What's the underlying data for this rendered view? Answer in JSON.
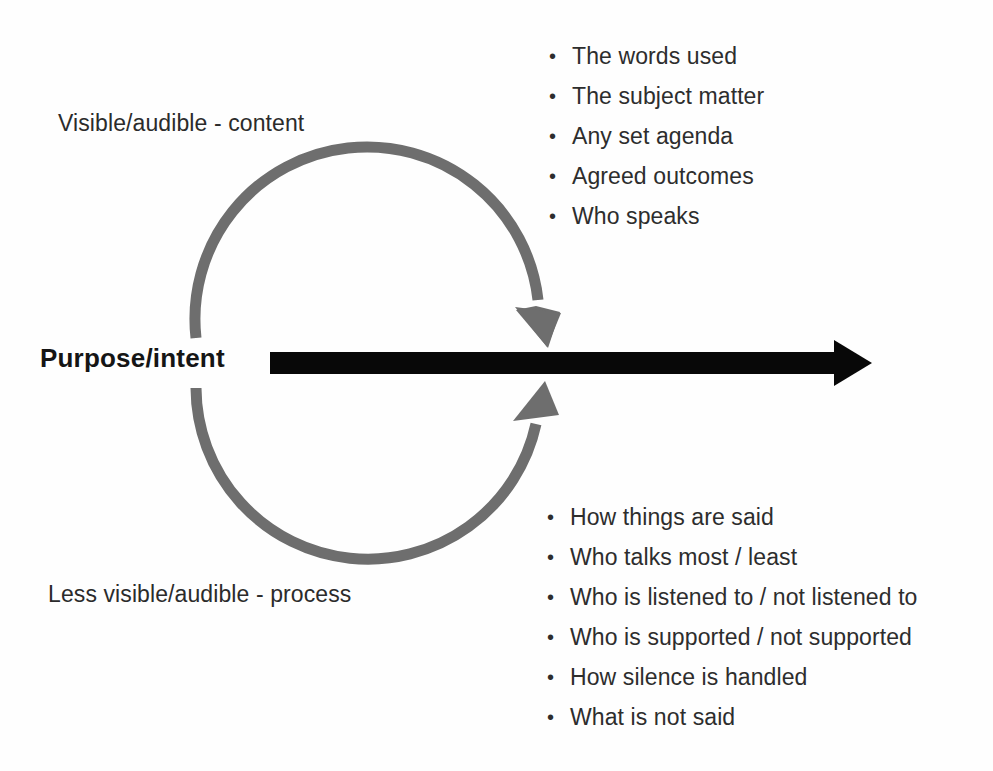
{
  "canvas": {
    "width": 993,
    "height": 771,
    "background": "#ffffff"
  },
  "diagram": {
    "title_text": "",
    "labels": {
      "upper_left": "Visible/audible - content",
      "lower_left": "Less visible/audible - process",
      "axis_label": "Purpose/intent"
    },
    "shapes": {
      "horizontal_arrow": {
        "name": "purpose-intent-arrow",
        "color": "#080808",
        "direction": "right",
        "shaft_start_x": 270,
        "shaft_end_x": 838,
        "tip_x": 872,
        "center_y": 363,
        "thickness": 22
      },
      "cycle_arrow_upper": {
        "name": "upper-cycle-arc",
        "color": "#6e6e6e",
        "direction": "clockwise-down-to-axis",
        "stroke_width": 11
      },
      "cycle_arrow_lower": {
        "name": "lower-cycle-arc",
        "color": "#6e6e6e",
        "direction": "clockwise-up-to-axis",
        "stroke_width": 11
      },
      "circle_geometry": {
        "center_x": 366,
        "center_y": 362,
        "radius": 172
      }
    },
    "content_bullets": [
      "The words used",
      "The subject matter",
      "Any set agenda",
      "Agreed outcomes",
      "Who speaks"
    ],
    "process_bullets": [
      "How things are said",
      "Who talks most / least",
      "Who is listened to / not listened to",
      "Who is supported / not supported",
      "How silence is handled",
      "What is not said"
    ],
    "bullet_glyph": "•"
  },
  "colors": {
    "text": "#2d2d2d",
    "bold_text": "#151515",
    "arrow_black": "#080808",
    "arc_gray": "#6e6e6e",
    "page": "#ffffff"
  }
}
